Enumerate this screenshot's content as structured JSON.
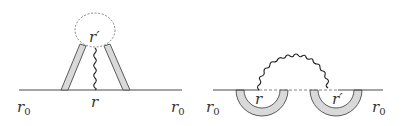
{
  "colors": {
    "line": "#4a4a4a",
    "band_fill": "#d9d9d9",
    "dashed": "#777777",
    "text": "#333333",
    "background": "#ffffff"
  },
  "diagrams": [
    {
      "name": "tadpole-diagram",
      "labels": {
        "left_end": {
          "main": "r",
          "sub": "0"
        },
        "vertex": "r",
        "loop_point": "r′",
        "right_end": {
          "main": "r",
          "sub": "0"
        }
      }
    },
    {
      "name": "exchange-diagram",
      "labels": {
        "left_end": {
          "main": "r",
          "sub": "0"
        },
        "vertex_left": "r",
        "vertex_right": "r′",
        "right_end": {
          "main": "r",
          "sub": "0"
        }
      }
    }
  ]
}
